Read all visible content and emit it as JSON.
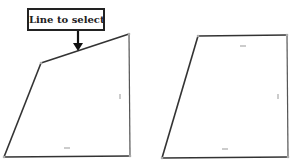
{
  "callout": {
    "label": "Line to select"
  },
  "colors": {
    "stroke": "#333333",
    "marker": "#999999",
    "vertex": "#aaaaaa"
  },
  "shapes": [
    {
      "name": "left-quadrilateral",
      "vertices": [
        [
          41,
          63
        ],
        [
          129,
          34
        ],
        [
          130,
          156
        ],
        [
          4,
          157
        ]
      ],
      "highlighted_edge": "top"
    },
    {
      "name": "right-quadrilateral",
      "vertices": [
        [
          198,
          36
        ],
        [
          287,
          35
        ],
        [
          288,
          157
        ],
        [
          162,
          158
        ]
      ]
    }
  ]
}
